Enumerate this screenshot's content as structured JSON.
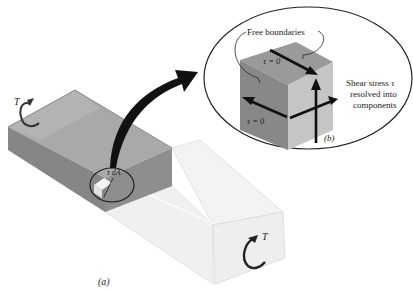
{
  "figure": {
    "part_a": {
      "label": "(a)",
      "torque_left": "T",
      "torque_right": "T",
      "element_label": "τ dA"
    },
    "part_b": {
      "label": "(b)",
      "free_boundaries": "Free boundaries",
      "tau_top": "τ = 0",
      "tau_left": "τ = 0",
      "shear_note_line1": "Shear stress τ",
      "shear_note_line2": "resolved into",
      "shear_note_line3": "components"
    }
  },
  "colors": {
    "dark_face": "#8c8c8c",
    "dark_top": "#a8a8a8",
    "dark_side": "#7a7a7a",
    "light_face": "#ececec",
    "light_top": "#f4f4f4",
    "cube_left": "#8a8a8a",
    "cube_top": "#9a9a9a",
    "cube_right": "#c4c4c4",
    "ink": "#1a1a1a"
  }
}
